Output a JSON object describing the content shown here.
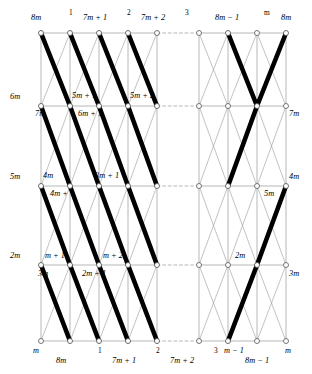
{
  "figure": {
    "kind": "graph-lattice-diagram",
    "colors": {
      "thick_edge": "#000000",
      "thin_edge": "#999999",
      "grid_line": "#9a9a9a",
      "node_stroke": "#555555",
      "node_fill": "#ffffff",
      "background": "#ffffff"
    },
    "grid": {
      "columns": 5,
      "rows": 5,
      "column_x": [
        41,
        70,
        99,
        128,
        157,
        199,
        228,
        257,
        286
      ],
      "row_y": [
        33,
        106,
        186,
        265,
        341
      ]
    }
  },
  "top_labels": [
    {
      "text": "8m",
      "x": 31,
      "y": 14,
      "style": "italic"
    },
    {
      "text": "1",
      "x": 69,
      "y": 9,
      "style": "sup"
    },
    {
      "text": "7m + 1",
      "x": 83,
      "y": 14,
      "style": "italic"
    },
    {
      "text": "2",
      "x": 127,
      "y": 9,
      "style": "sup"
    },
    {
      "text": "7m + 2",
      "x": 141,
      "y": 14,
      "style": "italic"
    },
    {
      "text": "3",
      "x": 185,
      "y": 9,
      "style": "sup"
    },
    {
      "text": "8m − 1",
      "x": 215,
      "y": 14,
      "style": "italic"
    },
    {
      "text": "m",
      "x": 264,
      "y": 9,
      "style": "sup"
    },
    {
      "text": "8m",
      "x": 281,
      "y": 14,
      "style": "italic"
    }
  ],
  "row2_labels": [
    {
      "text": "6m",
      "x": 10,
      "y": 93,
      "style": "italic"
    },
    {
      "text": "5m + 1",
      "x": 72,
      "y": 92,
      "style": "italic"
    },
    {
      "text": "5m + 2",
      "x": 130,
      "y": 92,
      "style": "italic"
    },
    {
      "text": "7m",
      "x": 35,
      "y": 110,
      "style": "italic"
    },
    {
      "text": "6m + 1",
      "x": 78,
      "y": 110,
      "style": "italic"
    },
    {
      "text": "7m",
      "x": 289,
      "y": 110,
      "style": "italic"
    }
  ],
  "row3_labels": [
    {
      "text": "5m",
      "x": 10,
      "y": 173,
      "style": "italic"
    },
    {
      "text": "4m",
      "x": 43,
      "y": 172,
      "style": "italic"
    },
    {
      "text": "3m + 1",
      "x": 95,
      "y": 172,
      "style": "italic"
    },
    {
      "text": "4m + 1",
      "x": 50,
      "y": 190,
      "style": "italic"
    },
    {
      "text": "5m",
      "x": 264,
      "y": 190,
      "style": "italic"
    },
    {
      "text": "4m",
      "x": 289,
      "y": 173,
      "style": "italic"
    }
  ],
  "row4_labels": [
    {
      "text": "2m",
      "x": 10,
      "y": 252,
      "style": "italic"
    },
    {
      "text": "m + 1",
      "x": 45,
      "y": 252,
      "style": "italic"
    },
    {
      "text": "m + 2",
      "x": 103,
      "y": 252,
      "style": "italic"
    },
    {
      "text": "3m",
      "x": 38,
      "y": 270,
      "style": "italic"
    },
    {
      "text": "2m + 1",
      "x": 82,
      "y": 270,
      "style": "italic"
    },
    {
      "text": "2m",
      "x": 235,
      "y": 252,
      "style": "italic"
    },
    {
      "text": "3m",
      "x": 289,
      "y": 270,
      "style": "italic"
    }
  ],
  "bottom_labels": [
    {
      "text": "m",
      "x": 33,
      "y": 347,
      "style": "italic"
    },
    {
      "text": "8m",
      "x": 56,
      "y": 357,
      "style": "italic"
    },
    {
      "text": "1",
      "x": 98,
      "y": 347,
      "style": "sup"
    },
    {
      "text": "7m + 1",
      "x": 112,
      "y": 357,
      "style": "italic"
    },
    {
      "text": "2",
      "x": 156,
      "y": 347,
      "style": "sup"
    },
    {
      "text": "7m + 2",
      "x": 170,
      "y": 357,
      "style": "italic"
    },
    {
      "text": "3",
      "x": 214,
      "y": 347,
      "style": "sup"
    },
    {
      "text": "m − 1",
      "x": 224,
      "y": 347,
      "style": "italic"
    },
    {
      "text": "8m − 1",
      "x": 245,
      "y": 357,
      "style": "italic"
    },
    {
      "text": "m",
      "x": 285,
      "y": 347,
      "style": "italic"
    }
  ],
  "legend": {
    "thick": "matching edge",
    "thin": "graph edge",
    "dashed": "omitted repeated section"
  }
}
